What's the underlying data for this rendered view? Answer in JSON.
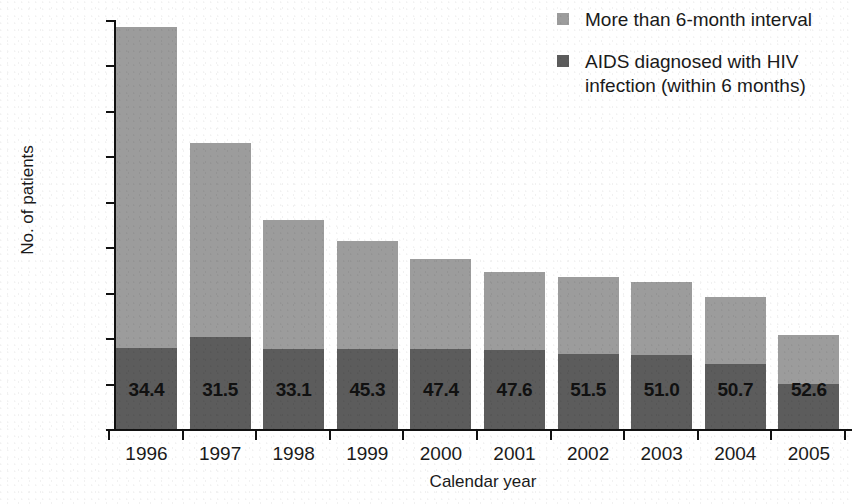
{
  "chart_data": {
    "type": "bar",
    "subtype": "stacked",
    "title": "",
    "xlabel": "Calendar year",
    "ylabel": "No. of patients",
    "categories": [
      "1996",
      "1997",
      "1998",
      "1999",
      "2000",
      "2001",
      "2002",
      "2003",
      "2004",
      "2005"
    ],
    "ylim": [
      0,
      4500
    ],
    "yticks": [
      0,
      500,
      1000,
      1500,
      2000,
      2500,
      3000,
      3500,
      4000,
      4500
    ],
    "ytick_labels": [
      "0",
      "500",
      "1000",
      "1500",
      "2000",
      "2500",
      "3000",
      "3500",
      "4000",
      "4500"
    ],
    "grid": false,
    "legend_position": "top-right",
    "series": [
      {
        "name": "AIDS diagnosed with HIV infection (within 6 months)",
        "color": "#5c5c5c",
        "values": [
          890,
          1010,
          880,
          880,
          880,
          870,
          820,
          810,
          710,
          490
        ]
      },
      {
        "name": "More than 6-month interval",
        "color": "#9c9c9c",
        "values": [
          3530,
          2140,
          1415,
          1190,
          990,
          855,
          850,
          810,
          740,
          545
        ]
      }
    ],
    "totals": [
      4420,
      3150,
      2295,
      2070,
      1870,
      1725,
      1670,
      1620,
      1450,
      1035
    ],
    "bar_labels": [
      "34.4",
      "31.5",
      "33.1",
      "45.3",
      "47.4",
      "47.6",
      "51.5",
      "51.0",
      "50.7",
      "52.6"
    ],
    "bar_label_note": "percentage diagnosed with HIV infection within 6 months"
  },
  "legend": {
    "items": [
      {
        "label": "More than 6-month interval",
        "color": "#9c9c9c"
      },
      {
        "label": "AIDS diagnosed with HIV infection (within 6 months)",
        "color": "#5c5c5c"
      }
    ]
  },
  "colors": {
    "light_segment": "#9c9c9c",
    "dark_segment": "#5c5c5c",
    "axis": "#111111",
    "text": "#1a1a1a",
    "background": "#ffffff"
  }
}
